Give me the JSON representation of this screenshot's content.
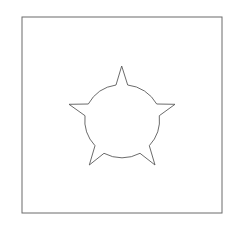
{
  "diagram": {
    "frame": {
      "x": 22,
      "y": 17,
      "width": 200,
      "height": 196,
      "stroke": "#6b6b6b"
    },
    "shape": {
      "kind": "circle-with-five-spikes",
      "stroke": "#5a5a5a",
      "fill": "#ffffff",
      "center": [
        122,
        118
      ],
      "radius": 37
    }
  }
}
